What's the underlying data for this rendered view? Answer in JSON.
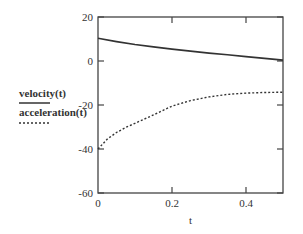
{
  "chart_data": {
    "type": "line",
    "title": "",
    "xlabel": "t",
    "ylabel": "",
    "xlim": [
      0,
      0.5
    ],
    "ylim": [
      -60,
      20
    ],
    "x_ticks": [
      0,
      0.2,
      0.4
    ],
    "x_tick_labels": [
      "0",
      "0.2",
      "0.4"
    ],
    "y_ticks": [
      20,
      0,
      -20,
      -40,
      -60
    ],
    "y_tick_labels": [
      "20",
      "0",
      "-20",
      "-40",
      "-60"
    ],
    "grid": false,
    "legend_position": "left",
    "series": [
      {
        "name": "velocity(t)",
        "style": "solid",
        "color": "#333333",
        "x": [
          0,
          0.05,
          0.1,
          0.15,
          0.2,
          0.25,
          0.3,
          0.35,
          0.4,
          0.45,
          0.5
        ],
        "values": [
          10.3,
          8.8,
          7.5,
          6.4,
          5.4,
          4.5,
          3.6,
          2.8,
          2.0,
          1.2,
          0.4
        ]
      },
      {
        "name": "acceleration(t)",
        "style": "dotted",
        "color": "#333333",
        "x": [
          0,
          0.025,
          0.05,
          0.075,
          0.1,
          0.15,
          0.2,
          0.25,
          0.3,
          0.35,
          0.4,
          0.45,
          0.5
        ],
        "values": [
          -40,
          -35.5,
          -32.5,
          -30.2,
          -28.3,
          -24.5,
          -20.5,
          -18.0,
          -16.3,
          -15.2,
          -14.6,
          -14.3,
          -14.2
        ]
      }
    ]
  }
}
